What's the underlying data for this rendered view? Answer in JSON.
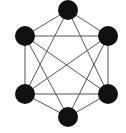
{
  "diagram": {
    "type": "graph",
    "colors": {
      "background": "#ffffff",
      "node_fill": "#111111",
      "edge_stroke": "#555555"
    },
    "node_radius": 10,
    "nodes": [
      {
        "id": "top",
        "x": 68,
        "y": 10
      },
      {
        "id": "upper-left",
        "x": 25,
        "y": 36
      },
      {
        "id": "upper-right",
        "x": 108,
        "y": 36
      },
      {
        "id": "lower-left",
        "x": 25,
        "y": 94
      },
      {
        "id": "lower-right",
        "x": 108,
        "y": 94
      },
      {
        "id": "bottom",
        "x": 68,
        "y": 117
      }
    ],
    "edges": [
      [
        "top",
        "upper-left"
      ],
      [
        "top",
        "upper-right"
      ],
      [
        "upper-left",
        "lower-left"
      ],
      [
        "upper-right",
        "lower-right"
      ],
      [
        "lower-left",
        "bottom"
      ],
      [
        "lower-right",
        "bottom"
      ],
      [
        "upper-left",
        "upper-right"
      ],
      [
        "lower-left",
        "lower-right"
      ],
      [
        "upper-left",
        "lower-right"
      ],
      [
        "upper-right",
        "lower-left"
      ],
      [
        "top",
        "lower-left"
      ],
      [
        "top",
        "lower-right"
      ],
      [
        "bottom",
        "upper-left"
      ],
      [
        "bottom",
        "upper-right"
      ]
    ]
  }
}
